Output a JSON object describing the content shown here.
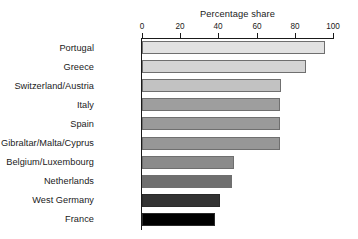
{
  "chart_data": {
    "type": "bar",
    "orientation": "horizontal",
    "title": "",
    "xlabel": "Percentage share",
    "ylabel": "",
    "xlim": [
      0,
      100
    ],
    "xticks": [
      0,
      20,
      40,
      60,
      80,
      100
    ],
    "xtick_labels": [
      "0",
      "20",
      "40",
      "60",
      "80",
      "100"
    ],
    "grid": false,
    "axis_position": "top",
    "legend": "none",
    "categories": [
      "Portugal",
      "Greece",
      "Switzerland/Austria",
      "Italy",
      "Spain",
      "Gibraltar/Malta/Cyprus",
      "Belgium/Luxembourg",
      "Netherlands",
      "West Germany",
      "France"
    ],
    "values": [
      96,
      86,
      73,
      72,
      72,
      72,
      48,
      47,
      41,
      38
    ],
    "bar_colors": [
      "#e2e2e2",
      "#d4d4d4",
      "#c2c2c2",
      "#9e9e9e",
      "#9a9a9a",
      "#979797",
      "#8b8b8b",
      "#6f6f6f",
      "#333333",
      "#000000"
    ]
  },
  "axis": {
    "title": "Percentage share"
  }
}
